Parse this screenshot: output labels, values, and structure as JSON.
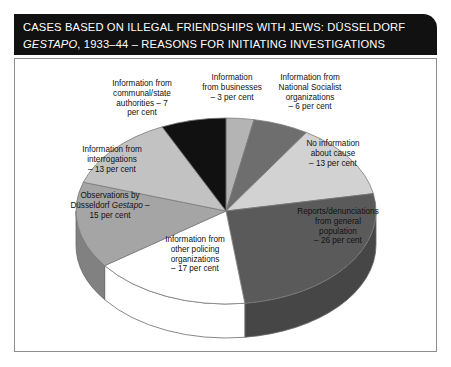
{
  "title": {
    "line1": "CASES BASED ON ILLEGAL FRIENDSHIPS WITH JEWS: DÜSSELDORF",
    "line2_italic": "GESTAPO",
    "line2_rest": ", 1933–44 – REASONS FOR INITIATING INVESTIGATIONS"
  },
  "labels": {
    "communal": "Information from\ncommunal/state\nauthorities – 7\nper cent",
    "business": "Information\nfrom businesses\n– 3 per cent",
    "nsorg": "Information from\nNational Socialist\norganizations\n– 6 per cent",
    "noinfo": "No information\nabout cause\n– 13 per cent",
    "reports": "Reports/denunciations\nfrom general\npopulation\n– 26 per cent",
    "policing": "Information from\nother policing\norganizations\n– 17 per cent",
    "observ_pre": "Observations by\nDüsseldorf ",
    "observ_italic": "Gestapo",
    "observ_post": " –\n15 per cent",
    "interrog": "Information from\ninterrogations\n– 13 per cent"
  },
  "chart_data": {
    "type": "pie",
    "title": "Cases based on illegal friendships with Jews: Düsseldorf Gestapo, 1933–44 – reasons for initiating investigations",
    "unit": "per cent",
    "start_angle_deg": 0,
    "direction": "clockwise",
    "three_d": true,
    "legend": "none (direct labels)",
    "categories": [
      "Information from businesses",
      "Information from National Socialist organizations",
      "No information about cause",
      "Reports/denunciations from general population",
      "Information from other policing organizations",
      "Observations by Düsseldorf Gestapo",
      "Information from interrogations",
      "Information from communal/state authorities"
    ],
    "values": [
      3,
      6,
      13,
      26,
      17,
      15,
      13,
      7
    ],
    "colors": [
      "#b4b4b4",
      "#6e6e6e",
      "#d2d2d2",
      "#5a5a5a",
      "#ffffff",
      "#a5a5a5",
      "#c2c2c2",
      "#111111"
    ],
    "total": 100
  }
}
